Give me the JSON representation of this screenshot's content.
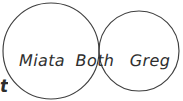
{
  "diagram": {
    "type": "venn",
    "title": "",
    "background_color": "#ffffff",
    "stroke_color": "#3f3f3f",
    "text_color": "#2e2e2e",
    "sets": [
      {
        "id": "left",
        "label": "Miata",
        "region": "left-only",
        "clipped_at_edge": "left"
      },
      {
        "id": "intersection",
        "label": "Both",
        "region": "overlap"
      },
      {
        "id": "right",
        "label": "Greg",
        "region": "right-only"
      }
    ],
    "edge_fragment": {
      "text": "t",
      "note": "partial character clipped at left border"
    }
  }
}
